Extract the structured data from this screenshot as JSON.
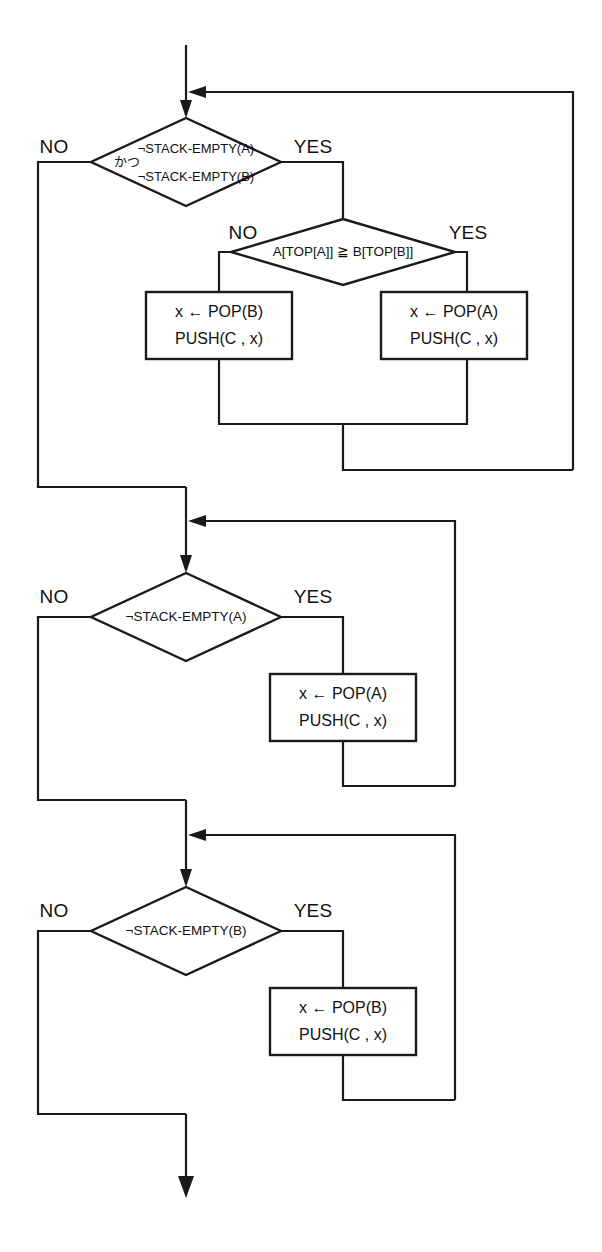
{
  "diagram": {
    "language_note": "かつ",
    "colors": {
      "stroke": "#1a1a1a",
      "background": "#ffffff",
      "text": "#111111"
    },
    "branch_labels": {
      "yes": "YES",
      "no": "NO"
    },
    "sections": [
      {
        "id": "section-1",
        "decision": {
          "line1": "¬STACK-EMPTY(A)",
          "conjunction": "かつ",
          "line2": "¬STACK-EMPTY(B)",
          "yes": "YES",
          "no": "NO"
        },
        "inner_decision": {
          "text": "A[TOP[A]] ≧ B[TOP[B]]",
          "yes": "YES",
          "no": "NO"
        },
        "process_no": {
          "line1": "x ← POP(B)",
          "line2": "PUSH(C , x)"
        },
        "process_yes": {
          "line1": "x ← POP(A)",
          "line2": "PUSH(C , x)"
        }
      },
      {
        "id": "section-2",
        "decision": {
          "text": "¬STACK-EMPTY(A)",
          "yes": "YES",
          "no": "NO"
        },
        "process_yes": {
          "line1": "x ← POP(A)",
          "line2": "PUSH(C , x)"
        }
      },
      {
        "id": "section-3",
        "decision": {
          "text": "¬STACK-EMPTY(B)",
          "yes": "YES",
          "no": "NO"
        },
        "process_yes": {
          "line1": "x ← POP(B)",
          "line2": "PUSH(C , x)"
        }
      }
    ]
  }
}
